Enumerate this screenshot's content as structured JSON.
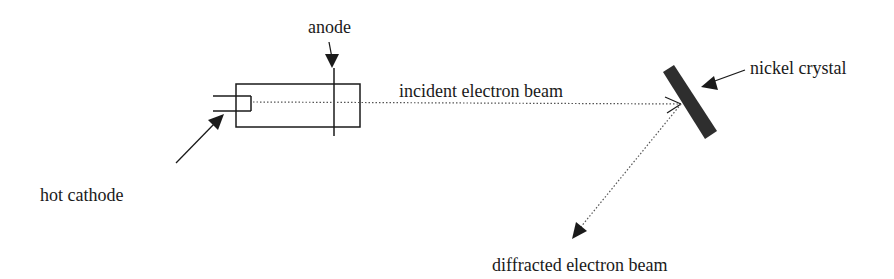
{
  "diagram": {
    "labels": {
      "anode": "anode",
      "hot_cathode": "hot cathode",
      "incident_beam": "incident electron beam",
      "nickel_crystal": "nickel crystal",
      "diffracted_beam": "diffracted electron beam"
    },
    "colors": {
      "stroke": "#1a1a1a",
      "crystal_fill": "#2e2e2e",
      "beam": "#555555",
      "background": "#ffffff"
    },
    "components": [
      {
        "id": "electron-gun-tube",
        "kind": "rectangle"
      },
      {
        "id": "hot-cathode",
        "kind": "filament"
      },
      {
        "id": "anode",
        "kind": "plate"
      },
      {
        "id": "nickel-crystal",
        "kind": "slab"
      },
      {
        "id": "incident-beam",
        "kind": "dotted-arrow"
      },
      {
        "id": "diffracted-beam",
        "kind": "dotted-arrow"
      }
    ]
  }
}
